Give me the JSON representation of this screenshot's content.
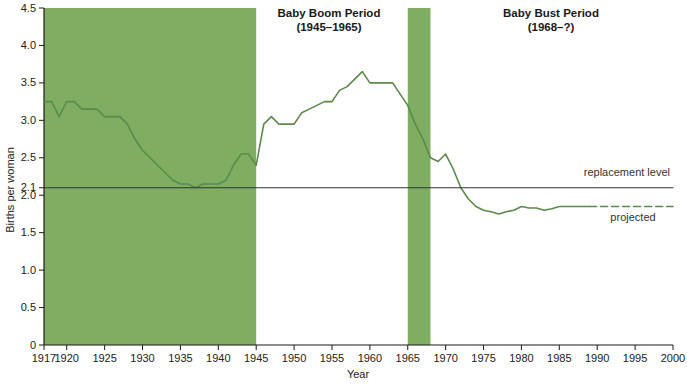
{
  "chart_data": {
    "type": "line",
    "title": "",
    "xlabel": "Year",
    "ylabel": "Births per woman",
    "xlim": [
      1917,
      2000
    ],
    "ylim": [
      0,
      4.5
    ],
    "grid": false,
    "legend_position": "inline-annotations",
    "xticks": [
      1917,
      1920,
      1925,
      1930,
      1935,
      1940,
      1945,
      1950,
      1955,
      1960,
      1965,
      1970,
      1975,
      1980,
      1985,
      1990,
      1995,
      2000
    ],
    "xtick_labels": [
      "1917",
      "1920",
      "1925",
      "1930",
      "1935",
      "1940",
      "1945",
      "1950",
      "1955",
      "1960",
      "1965",
      "1970",
      "1975",
      "1980",
      "1985",
      "1990",
      "1995",
      "2000"
    ],
    "yticks": [
      0,
      0.5,
      1.0,
      1.5,
      2.0,
      2.1,
      2.5,
      3.0,
      3.5,
      4.0,
      4.5
    ],
    "ytick_labels": [
      "0",
      "0.5",
      "1.0",
      "1.5",
      "2.0",
      "2.1",
      "2.5",
      "3.0",
      "3.5",
      "4.0",
      "4.5"
    ],
    "series": [
      {
        "name": "Total fertility rate (observed)",
        "style": "solid",
        "color": "#5b8a4a",
        "x": [
          1917,
          1918,
          1919,
          1920,
          1921,
          1922,
          1923,
          1924,
          1925,
          1926,
          1927,
          1928,
          1929,
          1930,
          1931,
          1932,
          1933,
          1934,
          1935,
          1936,
          1937,
          1938,
          1939,
          1940,
          1941,
          1942,
          1943,
          1944,
          1945,
          1946,
          1947,
          1948,
          1949,
          1950,
          1951,
          1952,
          1953,
          1954,
          1955,
          1956,
          1957,
          1958,
          1959,
          1960,
          1961,
          1962,
          1963,
          1964,
          1965,
          1966,
          1967,
          1968,
          1969,
          1970,
          1971,
          1972,
          1973,
          1974,
          1975,
          1976,
          1977,
          1978,
          1979,
          1980,
          1981,
          1982,
          1983,
          1984,
          1985,
          1986,
          1987,
          1988,
          1989
        ],
        "values": [
          3.25,
          3.25,
          3.05,
          3.25,
          3.25,
          3.15,
          3.15,
          3.15,
          3.05,
          3.05,
          3.05,
          2.95,
          2.75,
          2.6,
          2.5,
          2.4,
          2.3,
          2.2,
          2.15,
          2.15,
          2.1,
          2.15,
          2.15,
          2.15,
          2.2,
          2.4,
          2.55,
          2.55,
          2.4,
          2.95,
          3.05,
          2.95,
          2.95,
          2.95,
          3.1,
          3.15,
          3.2,
          3.25,
          3.25,
          3.4,
          3.45,
          3.55,
          3.65,
          3.5,
          3.5,
          3.5,
          3.5,
          3.35,
          3.2,
          2.95,
          2.75,
          2.5,
          2.45,
          2.55,
          2.35,
          2.1,
          1.95,
          1.85,
          1.8,
          1.78,
          1.75,
          1.78,
          1.8,
          1.85,
          1.83,
          1.83,
          1.8,
          1.82,
          1.85,
          1.85,
          1.85,
          1.85,
          1.85
        ]
      },
      {
        "name": "Total fertility rate (projected)",
        "style": "dashed",
        "color": "#5b8a4a",
        "x": [
          1989,
          1991,
          1993,
          1995,
          1997,
          2000
        ],
        "values": [
          1.85,
          1.85,
          1.85,
          1.85,
          1.85,
          1.85
        ]
      },
      {
        "name": "replacement level",
        "style": "solid",
        "color": "#333333",
        "x": [
          1917,
          2000
        ],
        "values": [
          2.1,
          2.1
        ]
      }
    ],
    "shaded_bands": [
      {
        "label": "baby-boom-band-early",
        "x0": 1917,
        "x1": 1945,
        "color": "#7fae62"
      },
      {
        "label": "baby-boom-band-late",
        "x0": 1965,
        "x1": 1968,
        "color": "#7fae62"
      }
    ],
    "annotations": [
      {
        "name": "baby-boom-title",
        "line1": "Baby Boom Period",
        "line2": "(1945–1965)"
      },
      {
        "name": "baby-bust-title",
        "line1": "Baby Bust Period",
        "line2": "(1968–?)"
      },
      {
        "name": "replacement-level-label",
        "text": "replacement level"
      },
      {
        "name": "projected-label",
        "text": "projected"
      }
    ]
  },
  "colors": {
    "band_green": "#7fae62",
    "line_green": "#5b8a4a",
    "replacement_black": "#2a2a2a",
    "axis_black": "#1a1a1a",
    "background": "#ffffff"
  },
  "axes": {
    "y_title": "Births per woman",
    "x_title": "Year"
  },
  "titles": {
    "boom_line1": "Baby Boom Period",
    "boom_line2": "(1945–1965)",
    "bust_line1": "Baby Bust Period",
    "bust_line2": "(1968–?)"
  },
  "labels": {
    "replacement_level": "replacement level",
    "projected": "projected"
  }
}
